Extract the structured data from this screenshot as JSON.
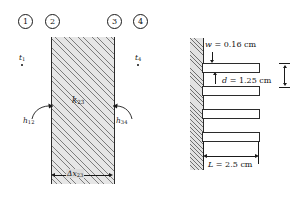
{
  "figure": {
    "left_diagram": {
      "nodes": [
        {
          "id": "1",
          "label": "1"
        },
        {
          "id": "2",
          "label": "2"
        },
        {
          "id": "3",
          "label": "3"
        },
        {
          "id": "4",
          "label": "4"
        }
      ],
      "surface_temp_left": {
        "symbol": "t",
        "subscript": "1"
      },
      "surface_temp_right": {
        "symbol": "t",
        "subscript": "4"
      },
      "conductance_left": {
        "symbol": "h",
        "subscript": "12"
      },
      "conductance_right": {
        "symbol": "h",
        "subscript": "34"
      },
      "conductivity": {
        "symbol": "k",
        "subscript": "23"
      },
      "thickness": {
        "symbol": "Δx",
        "subscript": "23"
      },
      "hatch_color": "#7d7d7d",
      "slab_fill": "#e6e6e6"
    },
    "right_diagram": {
      "dimensions": [
        {
          "name": "fin-thickness",
          "symbol": "w",
          "equals": "=",
          "value": "0.16",
          "unit": "cm"
        },
        {
          "name": "fin-spacing",
          "symbol": "d",
          "equals": "=",
          "value": "1.25",
          "unit": "cm"
        },
        {
          "name": "fin-length",
          "symbol": "L",
          "equals": "=",
          "value": "2.5",
          "unit": "cm"
        }
      ],
      "fin_count": 4,
      "wall_hatch_color": "#6f6f6f",
      "line_color": "#2b2b2b"
    }
  }
}
